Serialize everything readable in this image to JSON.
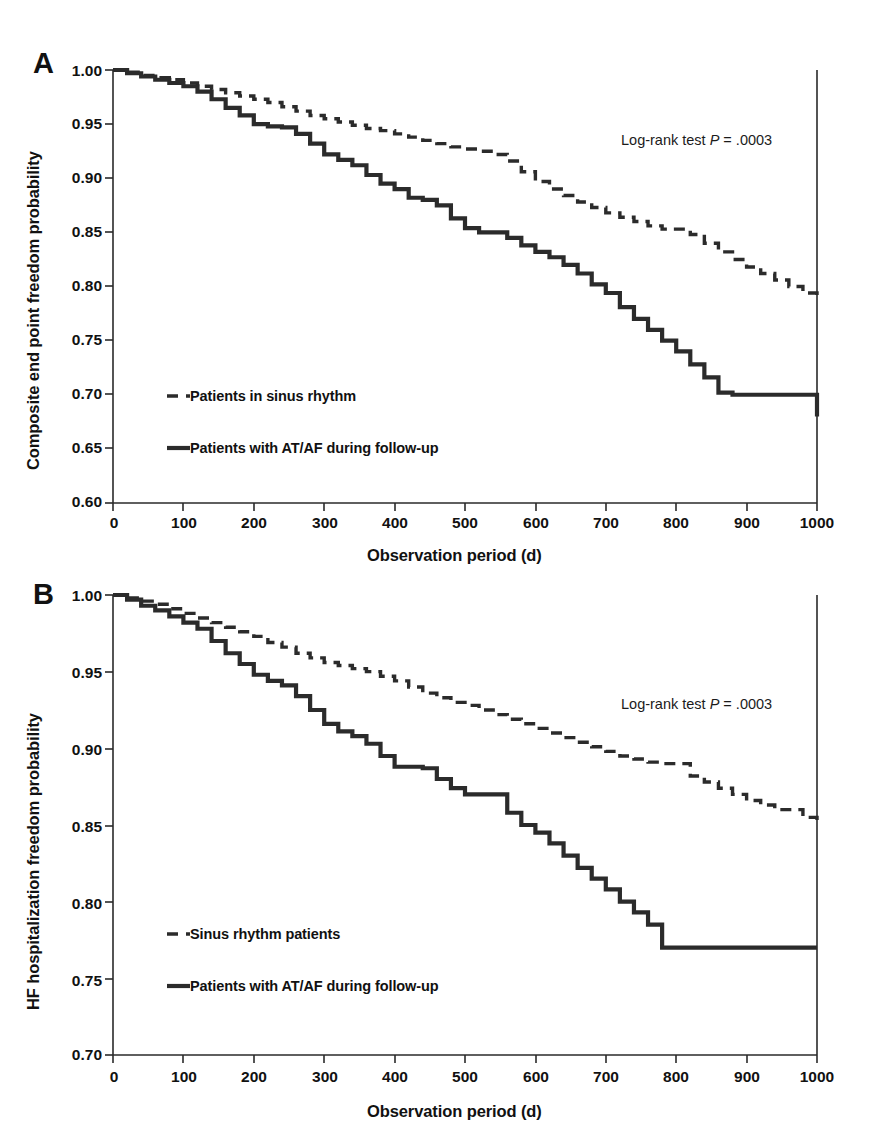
{
  "figure": {
    "background": "#ffffff",
    "ink_color": "#2b2b2b"
  },
  "panels": [
    {
      "letter": "A",
      "xlabel": "Observation period (d)",
      "ylabel": "Composite end point freedom probability",
      "annotation_prefix": "Log-rank test ",
      "annotation_italic": "P",
      "annotation_suffix": " = .0003",
      "yticks": [
        "1.00",
        "0.95",
        "0.90",
        "0.85",
        "0.80",
        "0.75",
        "0.70",
        "0.65",
        "0.60"
      ],
      "xticks": [
        "0",
        "100",
        "200",
        "300",
        "400",
        "500",
        "600",
        "700",
        "800",
        "900",
        "1000"
      ],
      "legend": [
        {
          "style": "dashed",
          "label": "Patients in sinus rhythm"
        },
        {
          "style": "solid",
          "label": "Patients with AT/AF during follow-up"
        }
      ]
    },
    {
      "letter": "B",
      "xlabel": "Observation period (d)",
      "ylabel": "HF hospitalization freedom probability",
      "annotation_prefix": "Log-rank test ",
      "annotation_italic": "P",
      "annotation_suffix": " = .0003",
      "yticks": [
        "1.00",
        "0.95",
        "0.90",
        "0.85",
        "0.80",
        "0.75",
        "0.70"
      ],
      "xticks": [
        "0",
        "100",
        "200",
        "300",
        "400",
        "500",
        "600",
        "700",
        "800",
        "900",
        "1000"
      ],
      "legend": [
        {
          "style": "dashed",
          "label": "Sinus rhythm patients"
        },
        {
          "style": "solid",
          "label": "Patients with AT/AF during follow-up"
        }
      ]
    }
  ],
  "chart_data": [
    {
      "type": "line",
      "panel": "A",
      "title": "Composite end point freedom probability by rhythm status",
      "xlabel": "Observation period (d)",
      "ylabel": "Composite end point freedom probability",
      "xlim": [
        0,
        1000
      ],
      "ylim": [
        0.6,
        1.0
      ],
      "xticks": [
        0,
        100,
        200,
        300,
        400,
        500,
        600,
        700,
        800,
        900,
        1000
      ],
      "yticks": [
        0.6,
        0.65,
        0.7,
        0.75,
        0.8,
        0.85,
        0.9,
        0.95,
        1.0
      ],
      "grid": false,
      "legend_position": "lower-left-inside",
      "annotations": [
        {
          "text": "Log-rank test P = .0003",
          "x": 700,
          "y": 0.935
        }
      ],
      "series": [
        {
          "name": "Patients in sinus rhythm",
          "style": "dashed",
          "curve_type": "kaplan-meier-step",
          "x": [
            0,
            20,
            40,
            60,
            80,
            100,
            120,
            140,
            160,
            180,
            200,
            220,
            240,
            260,
            280,
            300,
            320,
            340,
            360,
            380,
            400,
            420,
            440,
            460,
            480,
            500,
            520,
            540,
            560,
            580,
            600,
            620,
            640,
            660,
            680,
            700,
            720,
            740,
            760,
            780,
            800,
            820,
            840,
            860,
            880,
            900,
            920,
            940,
            960,
            980,
            1000
          ],
          "y": [
            1.0,
            0.998,
            0.995,
            0.993,
            0.991,
            0.988,
            0.985,
            0.982,
            0.979,
            0.976,
            0.973,
            0.97,
            0.966,
            0.962,
            0.958,
            0.955,
            0.952,
            0.949,
            0.946,
            0.944,
            0.941,
            0.938,
            0.935,
            0.932,
            0.929,
            0.927,
            0.925,
            0.922,
            0.916,
            0.906,
            0.897,
            0.89,
            0.884,
            0.878,
            0.873,
            0.868,
            0.864,
            0.86,
            0.856,
            0.853,
            0.853,
            0.848,
            0.84,
            0.832,
            0.825,
            0.818,
            0.812,
            0.806,
            0.8,
            0.794,
            0.787
          ]
        },
        {
          "name": "Patients with AT/AF during follow-up",
          "style": "solid",
          "curve_type": "kaplan-meier-step",
          "x": [
            0,
            20,
            40,
            60,
            80,
            100,
            120,
            140,
            160,
            180,
            200,
            220,
            240,
            260,
            280,
            300,
            320,
            340,
            360,
            380,
            400,
            420,
            440,
            460,
            480,
            500,
            520,
            540,
            560,
            580,
            600,
            620,
            640,
            660,
            680,
            700,
            720,
            740,
            760,
            780,
            800,
            820,
            840,
            860,
            880,
            900,
            920,
            940,
            960,
            980,
            1000
          ],
          "y": [
            1.0,
            0.997,
            0.994,
            0.991,
            0.988,
            0.985,
            0.98,
            0.973,
            0.965,
            0.958,
            0.95,
            0.948,
            0.947,
            0.941,
            0.932,
            0.922,
            0.917,
            0.912,
            0.903,
            0.895,
            0.89,
            0.882,
            0.88,
            0.875,
            0.863,
            0.854,
            0.85,
            0.85,
            0.845,
            0.838,
            0.832,
            0.827,
            0.82,
            0.812,
            0.802,
            0.794,
            0.781,
            0.77,
            0.76,
            0.75,
            0.74,
            0.728,
            0.716,
            0.702,
            0.7,
            0.7,
            0.7,
            0.7,
            0.7,
            0.7,
            0.68
          ]
        }
      ]
    },
    {
      "type": "line",
      "panel": "B",
      "title": "HF hospitalization freedom probability by rhythm status",
      "xlabel": "Observation period (d)",
      "ylabel": "HF hospitalization freedom probability",
      "xlim": [
        0,
        1000
      ],
      "ylim": [
        0.7,
        1.0
      ],
      "xticks": [
        0,
        100,
        200,
        300,
        400,
        500,
        600,
        700,
        800,
        900,
        1000
      ],
      "yticks": [
        0.7,
        0.75,
        0.8,
        0.85,
        0.9,
        0.95,
        1.0
      ],
      "grid": false,
      "legend_position": "lower-left-inside",
      "annotations": [
        {
          "text": "Log-rank test P = .0003",
          "x": 700,
          "y": 0.945
        }
      ],
      "series": [
        {
          "name": "Sinus rhythm patients",
          "style": "dashed",
          "curve_type": "kaplan-meier-step",
          "x": [
            0,
            20,
            40,
            60,
            80,
            100,
            120,
            140,
            160,
            180,
            200,
            220,
            240,
            260,
            280,
            300,
            320,
            340,
            360,
            380,
            400,
            420,
            440,
            460,
            480,
            500,
            520,
            540,
            560,
            580,
            600,
            620,
            640,
            660,
            680,
            700,
            720,
            740,
            760,
            780,
            800,
            820,
            840,
            860,
            880,
            900,
            920,
            940,
            960,
            980,
            1000
          ],
          "y": [
            1.0,
            0.998,
            0.996,
            0.994,
            0.991,
            0.988,
            0.985,
            0.982,
            0.979,
            0.976,
            0.973,
            0.969,
            0.966,
            0.962,
            0.959,
            0.956,
            0.954,
            0.952,
            0.95,
            0.947,
            0.944,
            0.94,
            0.936,
            0.933,
            0.93,
            0.928,
            0.925,
            0.922,
            0.919,
            0.916,
            0.913,
            0.91,
            0.907,
            0.904,
            0.901,
            0.898,
            0.895,
            0.893,
            0.891,
            0.89,
            0.89,
            0.882,
            0.878,
            0.874,
            0.87,
            0.866,
            0.863,
            0.86,
            0.86,
            0.855,
            0.85
          ]
        },
        {
          "name": "Patients with AT/AF during follow-up",
          "style": "solid",
          "curve_type": "kaplan-meier-step",
          "x": [
            0,
            20,
            40,
            60,
            80,
            100,
            120,
            140,
            160,
            180,
            200,
            220,
            240,
            260,
            280,
            300,
            320,
            340,
            360,
            380,
            400,
            420,
            440,
            460,
            480,
            500,
            520,
            540,
            560,
            580,
            600,
            620,
            640,
            660,
            680,
            700,
            720,
            740,
            760,
            780,
            800,
            820,
            840,
            860,
            880,
            900,
            920,
            940,
            960,
            980,
            1000
          ],
          "y": [
            1.0,
            0.997,
            0.993,
            0.99,
            0.986,
            0.982,
            0.978,
            0.97,
            0.962,
            0.955,
            0.948,
            0.944,
            0.941,
            0.934,
            0.925,
            0.916,
            0.911,
            0.908,
            0.903,
            0.895,
            0.888,
            0.888,
            0.887,
            0.88,
            0.874,
            0.87,
            0.87,
            0.87,
            0.858,
            0.85,
            0.845,
            0.838,
            0.83,
            0.822,
            0.815,
            0.808,
            0.8,
            0.793,
            0.785,
            0.77,
            0.77,
            0.77,
            0.77,
            0.77,
            0.77,
            0.77,
            0.77,
            0.77,
            0.77,
            0.77,
            0.77
          ]
        }
      ]
    }
  ]
}
